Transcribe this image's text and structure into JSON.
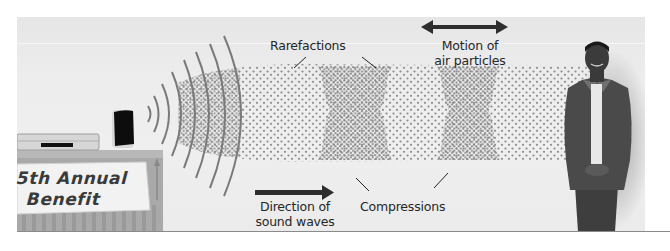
{
  "diagram": {
    "labels": {
      "rarefactions": "Rarefactions",
      "motion_line1": "Motion of",
      "motion_line2": "air particles",
      "direction_line1": "Direction of",
      "direction_line2": "sound waves",
      "compressions": "Compressions"
    },
    "banner": {
      "line1": "5th Annual",
      "line2": "Benefit"
    },
    "elements": [
      {
        "name": "table-with-stereo",
        "icon": "stereo-speaker-icon"
      },
      {
        "name": "sound-wave-arcs",
        "count": 8
      },
      {
        "name": "particle-field",
        "compressions": 2,
        "rarefactions": 2
      },
      {
        "name": "motion-arrow",
        "icon": "double-headed-arrow-icon"
      },
      {
        "name": "direction-arrow",
        "icon": "right-arrow-icon"
      },
      {
        "name": "listener-person",
        "icon": "person-figure"
      }
    ],
    "colors": {
      "panel_bg": "#ebebeb",
      "particles": "#8c8c8c",
      "arrow": "#333333",
      "text": "#262626",
      "rule": "#8a8a8a"
    }
  }
}
